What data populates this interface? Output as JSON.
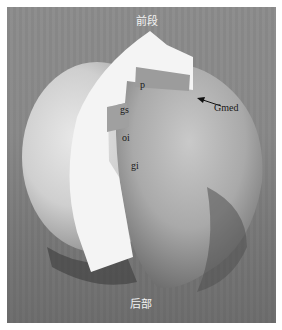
{
  "figure": {
    "orientation_labels": {
      "top": "前段",
      "bottom": "后部"
    },
    "structure_labels": {
      "p": "p",
      "gs": "gs",
      "oi": "oi",
      "gi": "gi",
      "gmed": "Gmed"
    },
    "colors": {
      "frame": "#ffffff",
      "background": "#8a8a8a",
      "paper": "#f4f4f4",
      "label_text_dark": "#1a1a1a",
      "label_text_light": "#f2f2f2"
    }
  }
}
